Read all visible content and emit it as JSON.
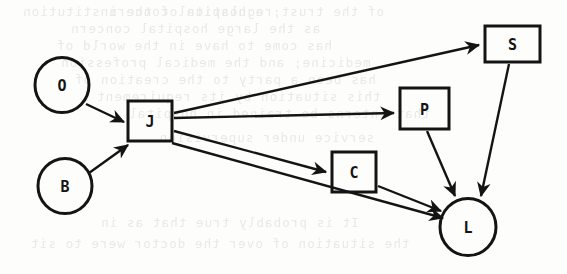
{
  "diagram": {
    "type": "directed-graph",
    "background_color": "#fdfdfc",
    "stroke_color": "#141414",
    "nodes": [
      {
        "id": "O",
        "label": "O",
        "shape": "circle",
        "cx": 62,
        "cy": 85,
        "r": 27
      },
      {
        "id": "B",
        "label": "B",
        "shape": "circle",
        "cx": 65,
        "cy": 186,
        "r": 27
      },
      {
        "id": "J",
        "label": "J",
        "shape": "rect",
        "x": 128,
        "y": 101,
        "w": 44,
        "h": 40
      },
      {
        "id": "S",
        "label": "S",
        "shape": "rect",
        "x": 485,
        "y": 26,
        "w": 55,
        "h": 36
      },
      {
        "id": "P",
        "label": "P",
        "shape": "rect",
        "x": 400,
        "y": 88,
        "w": 49,
        "h": 41
      },
      {
        "id": "C",
        "label": "C",
        "shape": "rect",
        "x": 332,
        "y": 152,
        "w": 44,
        "h": 40
      },
      {
        "id": "L",
        "label": "L",
        "shape": "circle",
        "cx": 468,
        "cy": 227,
        "r": 28
      }
    ],
    "edges": [
      {
        "from": "O",
        "to": "J",
        "x1": 86,
        "y1": 104,
        "x2": 124,
        "y2": 122
      },
      {
        "from": "B",
        "to": "J",
        "x1": 89,
        "y1": 173,
        "x2": 128,
        "y2": 145
      },
      {
        "from": "J",
        "to": "S",
        "x1": 174,
        "y1": 113,
        "x2": 479,
        "y2": 45
      },
      {
        "from": "J",
        "to": "P",
        "x1": 174,
        "y1": 118,
        "x2": 394,
        "y2": 113
      },
      {
        "from": "J",
        "to": "C",
        "x1": 174,
        "y1": 131,
        "x2": 326,
        "y2": 172
      },
      {
        "from": "J",
        "to": "L",
        "x1": 172,
        "y1": 143,
        "x2": 443,
        "y2": 218
      },
      {
        "from": "C",
        "to": "L",
        "x1": 378,
        "y1": 186,
        "x2": 441,
        "y2": 211
      },
      {
        "from": "P",
        "to": "L",
        "x1": 427,
        "y1": 131,
        "x2": 455,
        "y2": 196
      },
      {
        "from": "S",
        "to": "L",
        "x1": 509,
        "y1": 64,
        "x2": 481,
        "y2": 196
      }
    ]
  },
  "bleed_through": {
    "note": "faint mirrored text showing through from the reverse side of the scanned page",
    "color": "#e9e9e9",
    "lines": [
      {
        "text": "regulation of the institution",
        "x": 22,
        "y": 4
      },
      {
        "text": "of the trust; a hospital concern",
        "x": 108,
        "y": 4
      },
      {
        "text": "as the large hospital concern",
        "x": 70,
        "y": 21
      },
      {
        "text": "has come to have in the world of",
        "x": 56,
        "y": 38
      },
      {
        "text": "medicine; and the medical profession",
        "x": 60,
        "y": 55
      },
      {
        "text": "has been a party to the creation of",
        "x": 74,
        "y": 72
      },
      {
        "text": "this situation by its requirement",
        "x": 96,
        "y": 89
      },
      {
        "text": "that interns be trained in hospital",
        "x": 128,
        "y": 106
      },
      {
        "text": "service under supervision.",
        "x": 150,
        "y": 130
      },
      {
        "text": "It is probably true that as in",
        "x": 100,
        "y": 215
      },
      {
        "text": "the situation of over the doctor were to sit",
        "x": 30,
        "y": 236
      }
    ]
  }
}
